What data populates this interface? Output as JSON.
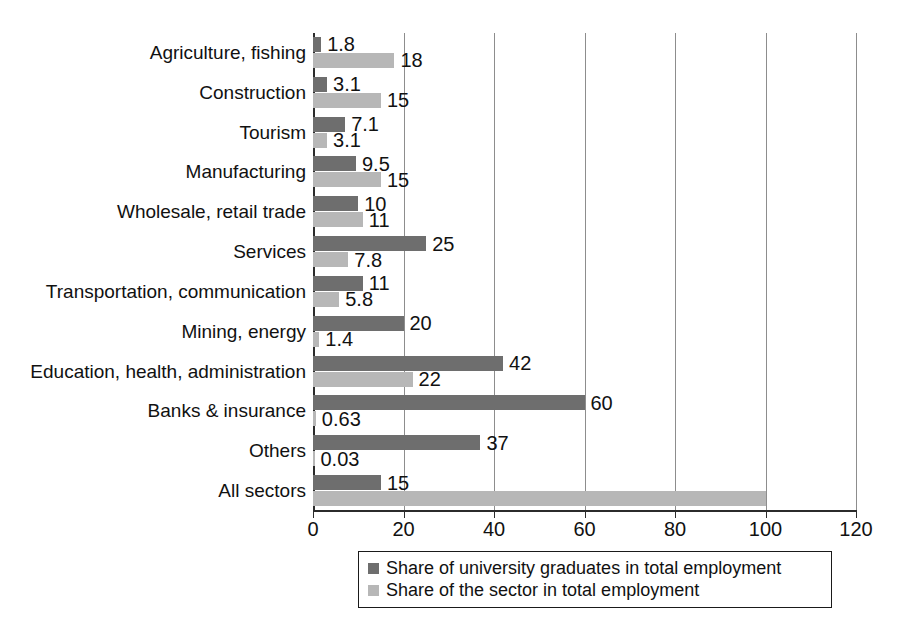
{
  "chart_data": {
    "type": "bar",
    "orientation": "horizontal",
    "title": "",
    "xlabel": "",
    "ylabel": "",
    "xlim": [
      0,
      120
    ],
    "xticks": [
      0,
      20,
      40,
      60,
      80,
      100,
      120
    ],
    "xtick_labels": [
      "0",
      "20",
      "40",
      "60",
      "80",
      "100",
      "120"
    ],
    "grid": true,
    "grid_axis": "x",
    "legend_position": "bottom-center",
    "categories": [
      "Agriculture, fishing",
      "Construction",
      "Tourism",
      "Manufacturing",
      "Wholesale, retail trade",
      "Services",
      "Transportation, communication",
      "Mining, energy",
      "Education, health, administration",
      "Banks & insurance",
      "Others",
      "All sectors"
    ],
    "series": [
      {
        "name": "Share of university graduates in total employment",
        "color": "#6e6e6e",
        "values": [
          1.8,
          3.1,
          7.1,
          9.5,
          10,
          25,
          11,
          20,
          42,
          60,
          37,
          15
        ],
        "labels": [
          "1.8",
          "3.1",
          "7.1",
          "9.5",
          "10",
          "25",
          "11",
          "20",
          "42",
          "60",
          "37",
          "15"
        ]
      },
      {
        "name": "Share of the sector in total employment",
        "color": "#b7b7b7",
        "values": [
          18,
          15,
          3.1,
          15,
          11,
          7.8,
          5.8,
          1.4,
          22,
          0.63,
          0.03,
          100
        ],
        "labels": [
          "18",
          "15",
          "3.1",
          "15",
          "11",
          "7.8",
          "5.8",
          "1.4",
          "22",
          "0.63",
          "0.03",
          ""
        ]
      }
    ]
  },
  "legend": {
    "items": [
      {
        "label": "Share of university graduates in total employment",
        "swatch": "#6e6e6e"
      },
      {
        "label": "Share of the sector in total employment",
        "swatch": "#b7b7b7"
      }
    ]
  },
  "caption": {
    "text": ""
  }
}
